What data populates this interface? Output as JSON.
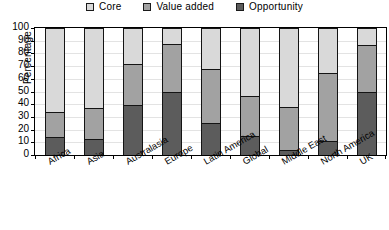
{
  "chart_data": {
    "type": "bar",
    "subtype": "stacked-bar-100",
    "title": "",
    "xlabel": "",
    "ylabel": "Percentage",
    "ylim": [
      0,
      100
    ],
    "ytick_step": 10,
    "yticks": [
      100,
      90,
      80,
      70,
      60,
      50,
      40,
      30,
      20,
      10,
      0
    ],
    "grid": true,
    "legend_position": "top-center",
    "categories": [
      "Africa",
      "Asia",
      "Australasia",
      "Europe",
      "Latin America",
      "Global",
      "Middle East",
      "North America",
      "UK"
    ],
    "series": [
      {
        "name": "Opportunity",
        "color": "#5c5c5c",
        "values": [
          14,
          13,
          40,
          50,
          25,
          15,
          4,
          11,
          50
        ]
      },
      {
        "name": "Value added",
        "color": "#a2a2a2",
        "values": [
          20,
          24,
          32,
          38,
          43,
          32,
          34,
          54,
          37
        ]
      },
      {
        "name": "Core",
        "color": "#d9d9d9",
        "values": [
          66,
          63,
          28,
          12,
          32,
          53,
          62,
          35,
          13
        ]
      }
    ],
    "cumulative_tops": {
      "Opportunity": [
        14,
        13,
        40,
        50,
        25,
        15,
        4,
        11,
        50
      ],
      "Value added": [
        34,
        37,
        72,
        88,
        68,
        47,
        38,
        65,
        87
      ],
      "Core": [
        100,
        100,
        100,
        100,
        100,
        100,
        100,
        100,
        100
      ]
    }
  },
  "legend": {
    "items": [
      {
        "label": "Core",
        "color": "#d9d9d9",
        "icon": "legend-swatch-icon"
      },
      {
        "label": "Value added",
        "color": "#a2a2a2",
        "icon": "legend-swatch-icon"
      },
      {
        "label": "Opportunity",
        "color": "#5c5c5c",
        "icon": "legend-swatch-icon"
      }
    ]
  }
}
